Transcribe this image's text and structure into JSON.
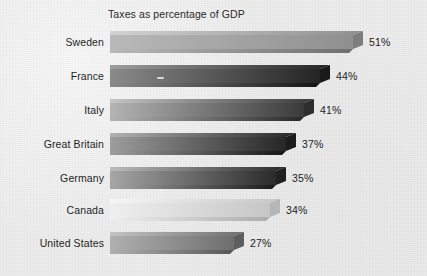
{
  "chart_data": {
    "type": "bar",
    "orientation": "horizontal",
    "title": "Taxes as percentage of GDP",
    "xlabel": "",
    "ylabel": "",
    "categories": [
      "Sweden",
      "France",
      "Italy",
      "Great Britain",
      "Germany",
      "Canada",
      "United States"
    ],
    "values": [
      51,
      44,
      41,
      37,
      35,
      34,
      27
    ],
    "value_labels": [
      "51%",
      "44%",
      "41%",
      "37%",
      "35%",
      "34%",
      "27%"
    ],
    "unit": "%",
    "xlim": [
      0,
      51
    ],
    "grid": false,
    "legend": null,
    "style": "3d-beveled-horizontal-bars",
    "bars": [
      {
        "category": "Sweden",
        "value": 51,
        "value_label": "51%",
        "bar_top": 31,
        "bar_height": 22,
        "bar_length": 253,
        "face_light": "#b9b9b9",
        "face_dark": "#8f8f8f",
        "top_face": "#d2d2d2",
        "end_face": "#7d7d7d",
        "shadow": "#6f6f6f",
        "label_top": 36,
        "value_left": 369,
        "value_top": 36
      },
      {
        "category": "France",
        "value": 44,
        "value_label": "44%",
        "bar_top": 65,
        "bar_height": 22,
        "bar_length": 220,
        "face_light": "#8a8a8a",
        "face_dark": "#242424",
        "top_face": "#9e9e9e",
        "end_face": "#1a1a1a",
        "shadow": "#141414",
        "label_top": 70,
        "value_left": 336,
        "value_top": 70
      },
      {
        "category": "Italy",
        "value": 41,
        "value_label": "41%",
        "bar_top": 99,
        "bar_height": 22,
        "bar_length": 204,
        "face_light": "#b4b4b4",
        "face_dark": "#3a3a3a",
        "top_face": "#c6c6c6",
        "end_face": "#2e2e2e",
        "shadow": "#282828",
        "label_top": 104,
        "value_left": 320,
        "value_top": 104
      },
      {
        "category": "Great Britain",
        "value": 37,
        "value_label": "37%",
        "bar_top": 133,
        "bar_height": 22,
        "bar_length": 186,
        "face_light": "#9d9d9d",
        "face_dark": "#262626",
        "top_face": "#b2b2b2",
        "end_face": "#1c1c1c",
        "shadow": "#161616",
        "label_top": 138,
        "value_left": 302,
        "value_top": 138
      },
      {
        "category": "Germany",
        "value": 35,
        "value_label": "35%",
        "bar_top": 167,
        "bar_height": 22,
        "bar_length": 176,
        "face_light": "#a6a6a6",
        "face_dark": "#2a2a2a",
        "top_face": "#bcbcbc",
        "end_face": "#202020",
        "shadow": "#191919",
        "label_top": 172,
        "value_left": 292,
        "value_top": 172
      },
      {
        "category": "Canada",
        "value": 34,
        "value_label": "34%",
        "bar_top": 199,
        "bar_height": 22,
        "bar_length": 170,
        "face_light": "#efefef",
        "face_dark": "#c6c6c6",
        "top_face": "#f6f6f6",
        "end_face": "#b6b6b6",
        "shadow": "#acacac",
        "label_top": 204,
        "value_left": 286,
        "value_top": 204
      },
      {
        "category": "United States",
        "value": 27,
        "value_label": "27%",
        "bar_top": 232,
        "bar_height": 22,
        "bar_length": 134,
        "face_light": "#b0b0b0",
        "face_dark": "#6e6e6e",
        "top_face": "#c3c3c3",
        "end_face": "#5e5e5e",
        "shadow": "#565656",
        "label_top": 237,
        "value_left": 250,
        "value_top": 237
      }
    ]
  }
}
